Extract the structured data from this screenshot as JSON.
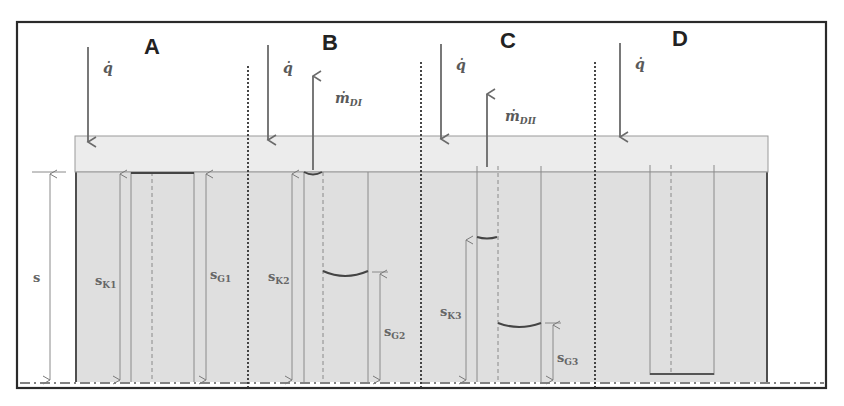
{
  "figure": {
    "colors": {
      "frame": "#2a2a2a",
      "top_layer_fill": "#e9e9e9",
      "body_fill": "#dedede",
      "line_gray": "#7a7a7a",
      "meniscus": "#444444",
      "text": "#5a5a5a"
    }
  },
  "panels": [
    {
      "id": "A",
      "title": "A",
      "heat_flux_label": "q̇",
      "mass_flux_label": null,
      "dimensions": [
        {
          "label": "s",
          "sub": ""
        },
        {
          "label": "s",
          "sub": "K1"
        },
        {
          "label": "s",
          "sub": "G1"
        }
      ]
    },
    {
      "id": "B",
      "title": "B",
      "heat_flux_label": "q̇",
      "mass_flux_label": "ṁ",
      "mass_flux_sub": "DI",
      "dimensions": [
        {
          "label": "s",
          "sub": "K2"
        },
        {
          "label": "s",
          "sub": "G2"
        }
      ]
    },
    {
      "id": "C",
      "title": "C",
      "heat_flux_label": "q̇",
      "mass_flux_label": "ṁ",
      "mass_flux_sub": "DII",
      "dimensions": [
        {
          "label": "s",
          "sub": "K3"
        },
        {
          "label": "s",
          "sub": "G3"
        }
      ]
    },
    {
      "id": "D",
      "title": "D",
      "heat_flux_label": "q̇",
      "mass_flux_label": null,
      "dimensions": []
    }
  ],
  "labels": {
    "A_title": "A",
    "B_title": "B",
    "C_title": "C",
    "D_title": "D",
    "q": "q̇",
    "m": "ṁ",
    "m_sub_B": "DI",
    "m_sub_C": "DII",
    "s": "s",
    "s_sub_K1": "K1",
    "s_sub_G1": "G1",
    "s_sub_K2": "K2",
    "s_sub_G2": "G2",
    "s_sub_K3": "K3",
    "s_sub_G3": "G3"
  }
}
